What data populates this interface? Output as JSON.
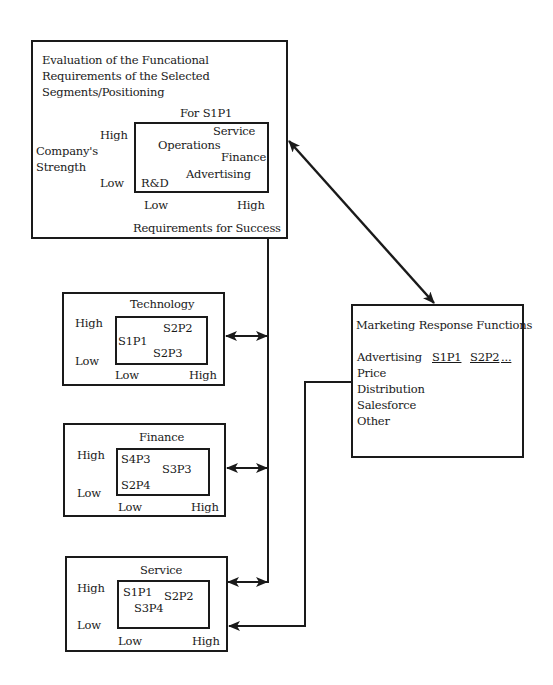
{
  "main_panel": {
    "title_lines": [
      "Evaluation of the Funcational",
      "Requirements of the Selected",
      "Segments/Positioning"
    ],
    "matrix_title": "For S1P1",
    "y_axis_label_lines": [
      "Company's",
      "Strength"
    ],
    "y_high": "High",
    "y_low": "Low",
    "x_low": "Low",
    "x_high": "High",
    "x_axis_label": "Requirements for Success",
    "items": [
      "Service",
      "Operations",
      "Finance",
      "Advertising",
      "R&D"
    ]
  },
  "function_panels": [
    {
      "title": "Technology",
      "y_high": "High",
      "y_low": "Low",
      "x_low": "Low",
      "x_high": "High",
      "items": [
        "S2P2",
        "S1P1",
        "S2P3"
      ]
    },
    {
      "title": "Finance",
      "y_high": "High",
      "y_low": "Low",
      "x_low": "Low",
      "x_high": "High",
      "items": [
        "S4P3",
        "S3P3",
        "S2P4"
      ]
    },
    {
      "title": "Service",
      "y_high": "High",
      "y_low": "Low",
      "x_low": "Low",
      "x_high": "High",
      "items": [
        "S1P1",
        "S2P2",
        "S3P4"
      ]
    }
  ],
  "marketing_panel": {
    "title": "Marketing Response Functions",
    "columns": [
      "S1P1",
      "S2P2",
      "..."
    ],
    "rows": [
      "Advertising",
      "Price",
      "Distribution",
      "Salesforce",
      "Other"
    ]
  },
  "connectors": [
    {
      "from": "main_panel",
      "to": "marketing_panel",
      "type": "bidirectional-diagonal"
    },
    {
      "from": "function_panels.technology",
      "to": "bus-line",
      "type": "bidirectional"
    },
    {
      "from": "function_panels.finance",
      "to": "bus-line",
      "type": "bidirectional"
    },
    {
      "from": "function_panels.service",
      "to": "bus-line",
      "type": "bidirectional"
    },
    {
      "from": "marketing_panel",
      "to": "function_panels.service",
      "type": "unidirectional"
    }
  ]
}
